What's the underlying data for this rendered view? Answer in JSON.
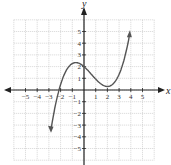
{
  "chart_data": {
    "type": "line",
    "title": "",
    "xlabel": "x",
    "ylabel": "y",
    "xlim": [
      -6,
      6
    ],
    "ylim": [
      -6,
      6
    ],
    "grid": true,
    "x_ticks": [
      "-5",
      "-4",
      "-3",
      "-2",
      "-1",
      "1",
      "2",
      "3",
      "4",
      "5"
    ],
    "y_ticks": [
      "5",
      "4",
      "3",
      "2",
      "1",
      "-1",
      "-2",
      "-3",
      "-4",
      "-5"
    ],
    "series": [
      {
        "name": "cubic polynomial",
        "x": [
          -2.8,
          -2.3,
          -1.5,
          -0.7,
          0,
          1,
          2,
          3,
          3.9
        ],
        "y": [
          -3.0,
          0,
          1.9,
          2.35,
          2.0,
          0.9,
          0.3,
          1.6,
          4.6
        ]
      }
    ],
    "features": {
      "local_max": [
        -0.7,
        2.35
      ],
      "local_min": [
        2,
        0.3
      ],
      "y_intercept": 2,
      "x_intercept": -2.3
    }
  }
}
